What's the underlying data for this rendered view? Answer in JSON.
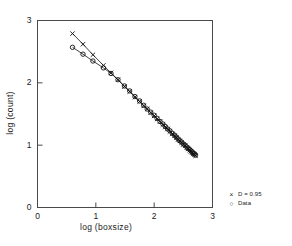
{
  "chart_data": {
    "type": "scatter",
    "title": "",
    "xlabel": "log (boxsize)",
    "ylabel": "log (count)",
    "xlim": [
      0,
      3
    ],
    "ylim": [
      0,
      3
    ],
    "xticks": [
      0,
      1,
      2,
      3
    ],
    "yticks": [
      0,
      1,
      2,
      3
    ],
    "xtick_labels": [
      "0",
      "1",
      "2",
      "3"
    ],
    "ytick_labels": [
      "0",
      "1",
      "2",
      "3"
    ],
    "grid": false,
    "legend_position": "outside-bottom-right",
    "series": [
      {
        "name": "D = 0.95",
        "marker": "x",
        "color": "#111111",
        "line": true,
        "x": [
          0.6,
          0.78,
          0.95,
          1.13,
          1.26,
          1.38,
          1.49,
          1.58,
          1.67,
          1.75,
          1.82,
          1.88,
          1.94,
          2.0,
          2.05,
          2.1,
          2.15,
          2.19,
          2.23,
          2.27,
          2.31,
          2.35,
          2.38,
          2.41,
          2.44,
          2.47,
          2.5,
          2.53,
          2.56,
          2.58,
          2.61,
          2.63,
          2.65,
          2.67,
          2.69,
          2.71
        ],
        "y": [
          2.79,
          2.62,
          2.45,
          2.28,
          2.16,
          2.05,
          1.94,
          1.86,
          1.77,
          1.7,
          1.63,
          1.58,
          1.52,
          1.47,
          1.42,
          1.38,
          1.33,
          1.29,
          1.26,
          1.22,
          1.18,
          1.15,
          1.12,
          1.09,
          1.07,
          1.04,
          1.01,
          0.99,
          0.96,
          0.94,
          0.92,
          0.9,
          0.88,
          0.86,
          0.85,
          0.83
        ]
      },
      {
        "name": "Data",
        "marker": "o",
        "color": "#111111",
        "line": true,
        "x": [
          0.6,
          0.78,
          0.95,
          1.13,
          1.26,
          1.38,
          1.49,
          1.58,
          1.67,
          1.75,
          1.82,
          1.88,
          1.94,
          2.0,
          2.05,
          2.1,
          2.15,
          2.19,
          2.23,
          2.27,
          2.31,
          2.35,
          2.38,
          2.41,
          2.44,
          2.47,
          2.5,
          2.53,
          2.56,
          2.58,
          2.61,
          2.63,
          2.65,
          2.67,
          2.69,
          2.71
        ],
        "y": [
          2.57,
          2.46,
          2.35,
          2.24,
          2.15,
          2.05,
          1.95,
          1.87,
          1.78,
          1.71,
          1.64,
          1.58,
          1.53,
          1.48,
          1.43,
          1.38,
          1.34,
          1.3,
          1.26,
          1.23,
          1.19,
          1.16,
          1.13,
          1.1,
          1.07,
          1.05,
          1.02,
          1.0,
          0.97,
          0.95,
          0.93,
          0.91,
          0.89,
          0.87,
          0.86,
          0.84
        ]
      }
    ],
    "legend": [
      {
        "marker": "×",
        "label": "D = 0.95"
      },
      {
        "marker": "○",
        "label": "Data"
      }
    ]
  }
}
